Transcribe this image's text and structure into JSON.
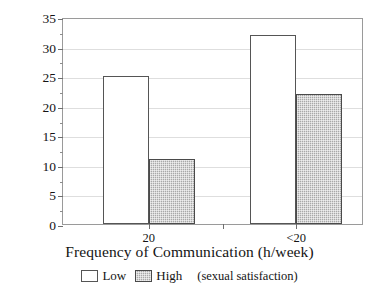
{
  "chart_data": {
    "type": "bar",
    "title": "",
    "subtitle": "",
    "xlabel": "Frequency of Communication (h/week)",
    "ylabel": "% Divorce Possible",
    "categories": [
      "20",
      "<20"
    ],
    "series": [
      {
        "name": "Low",
        "values": [
          25,
          32
        ],
        "fill": "white",
        "edge": "#555555"
      },
      {
        "name": "High",
        "values": [
          11,
          22
        ],
        "fill": "#a8a8a8",
        "edge": "#4a4a4a"
      }
    ],
    "ylim": [
      0,
      35
    ],
    "ytick_values": [
      0,
      5,
      10,
      15,
      20,
      25,
      30,
      35
    ],
    "ytick_labels": [
      "0",
      "5",
      "10",
      "15",
      "20",
      "25",
      "30",
      "35"
    ],
    "yminor_tick_values": [
      2.5,
      7.5,
      12.5,
      17.5,
      22.5,
      27.5,
      32.5
    ],
    "grid": true,
    "grid_axis": "y",
    "grid_color": "#dedede",
    "legend_position": "below",
    "legend_note": "(sexual satisfaction)",
    "frame": true,
    "frame_color": "#9a9a9a"
  },
  "axes": {
    "y_title": "% Divorce Possible",
    "x_title": "Frequency of Communication (h/week)"
  },
  "legend": {
    "entries": [
      {
        "label": "Low"
      },
      {
        "label": "High"
      }
    ],
    "note": "(sexual satisfaction)"
  },
  "colors": {
    "low_fill": "#ffffff",
    "high_fill": "#a8a8a8",
    "bar_edge": "#555555",
    "grid": "#dedede",
    "frame": "#9a9a9a",
    "text": "#141414"
  }
}
